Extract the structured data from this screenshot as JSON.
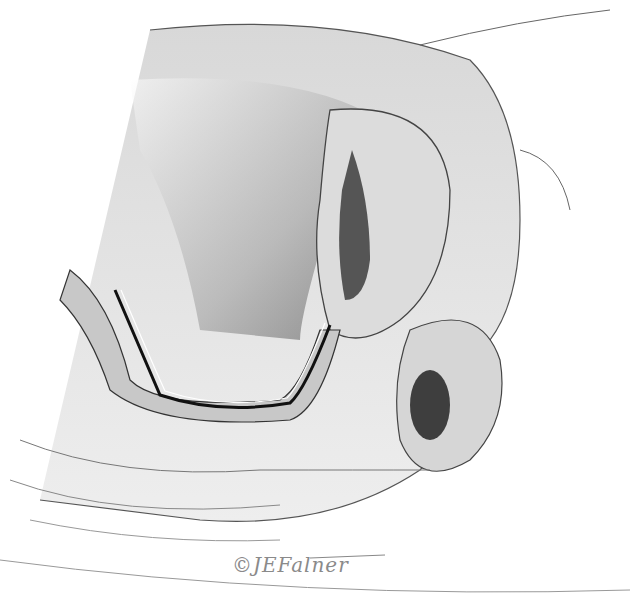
{
  "illustration": {
    "subject": "Sagittal cross-section of pelvic anatomy with tubular instrument",
    "signature": "©JEFalner",
    "colors": {
      "background": "#ffffff",
      "tissue_light": "#e6e6e6",
      "tissue_mid": "#bdbdbd",
      "tissue_dark": "#5a5a5a",
      "outline": "#3a3a3a"
    }
  }
}
